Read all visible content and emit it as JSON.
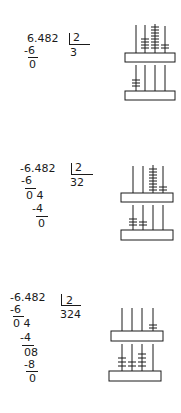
{
  "problem": {
    "dividend": "6.482",
    "divisor": "2"
  },
  "steps": [
    {
      "dividend_text": "6.482",
      "divisor_text": "2",
      "quotient_text": "3",
      "work_lines": [
        {
          "text": "-6",
          "underline": true
        },
        {
          "text": "0",
          "underline": false
        }
      ],
      "abacus": {
        "upper_rods": [
          0,
          4,
          8,
          2
        ],
        "lower_rods": [
          3,
          0,
          0,
          0
        ]
      }
    },
    {
      "dividend_text": "-6.482",
      "divisor_text": "2",
      "quotient_text": "32",
      "work_lines": [
        {
          "text": "-6",
          "underline": true
        },
        {
          "text": "0 4",
          "underline": false
        },
        {
          "text": "-4",
          "underline": true
        },
        {
          "text": "0",
          "underline": false
        }
      ],
      "abacus": {
        "upper_rods": [
          0,
          0,
          8,
          2
        ],
        "lower_rods": [
          3,
          2,
          0,
          0
        ]
      }
    },
    {
      "dividend_text": "-6.482",
      "divisor_text": "2",
      "quotient_text": "324",
      "work_lines": [
        {
          "text": "-6",
          "underline": true
        },
        {
          "text": "0 4",
          "underline": false
        },
        {
          "text": "-4",
          "underline": true
        },
        {
          "text": "08",
          "underline": false
        },
        {
          "text": "-8",
          "underline": true
        },
        {
          "text": "0",
          "underline": false
        }
      ],
      "abacus": {
        "upper_rods": [
          0,
          0,
          0,
          2
        ],
        "lower_rods": [
          3,
          2,
          4,
          0
        ]
      }
    }
  ],
  "colors": {
    "ink": "#1a1a1a",
    "paper": "#ffffff"
  }
}
